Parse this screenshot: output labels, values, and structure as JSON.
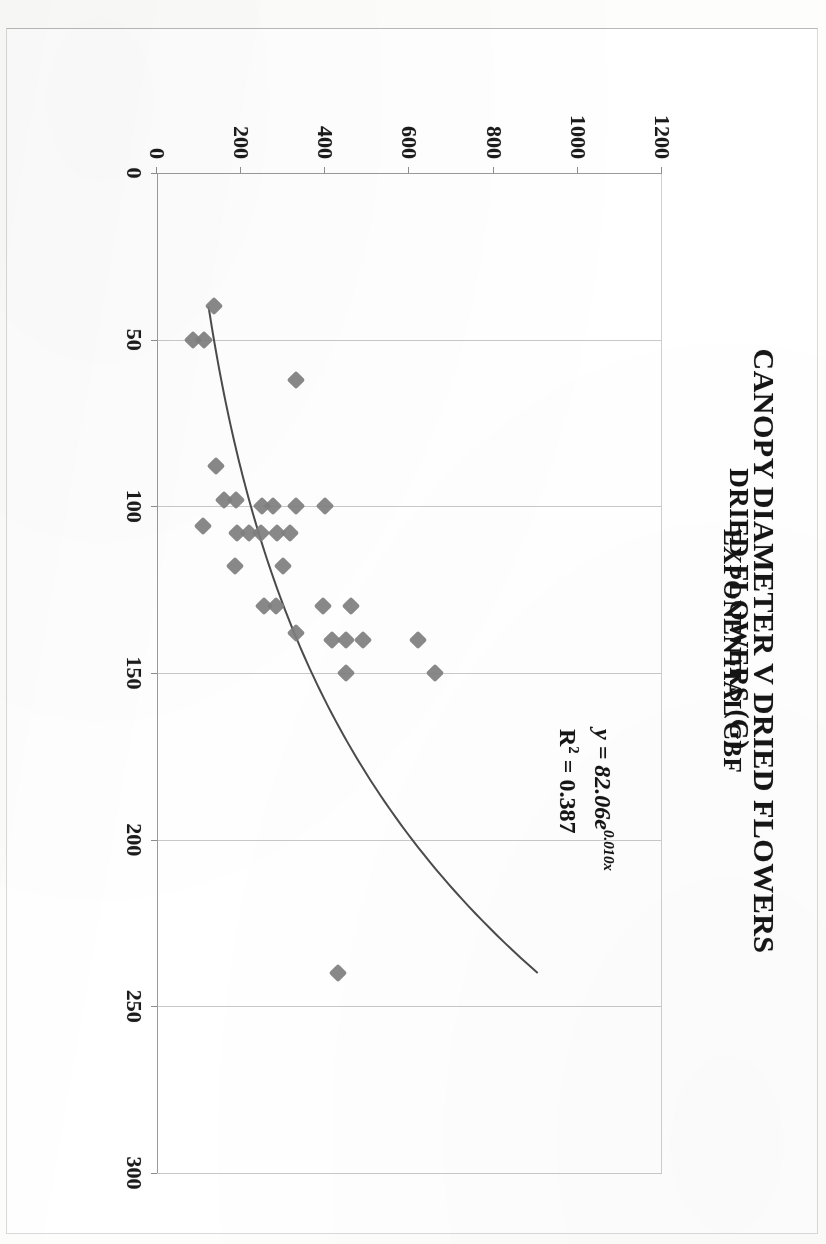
{
  "chart_data": {
    "type": "scatter",
    "title": "CANOPY DIAMETER V DRIED FLOWERS",
    "subtitle": "EXPONENTIAL CBF",
    "xlabel": "CANOPY DIAMETER (CM)",
    "ylabel": "DRIED FLOWERS (G)",
    "xlim": [
      0,
      300
    ],
    "ylim": [
      0,
      1200
    ],
    "xticks": [
      0,
      50,
      100,
      150,
      200,
      250,
      300
    ],
    "yticks": [
      0,
      200,
      400,
      600,
      800,
      1000,
      1200
    ],
    "grid": true,
    "legend": "none",
    "marker": "diamond",
    "marker_color": "#7f7f7f",
    "trendline": {
      "kind": "exponential",
      "equation_text": "y = 82.06e",
      "equation_exponent": "0.010x",
      "r2_label": "R",
      "r2_sup": "2",
      "r2_text": " = 0.387",
      "coefficient": 82.06,
      "rate": 0.01,
      "r_squared": 0.387,
      "color": "#4b4b4b",
      "x_start": 40,
      "x_end": 240
    },
    "points": [
      {
        "x": 40,
        "y": 135
      },
      {
        "x": 50,
        "y": 85
      },
      {
        "x": 50,
        "y": 112
      },
      {
        "x": 62,
        "y": 330
      },
      {
        "x": 88,
        "y": 140
      },
      {
        "x": 98,
        "y": 160
      },
      {
        "x": 98,
        "y": 188
      },
      {
        "x": 100,
        "y": 250
      },
      {
        "x": 100,
        "y": 275
      },
      {
        "x": 100,
        "y": 330
      },
      {
        "x": 100,
        "y": 400
      },
      {
        "x": 106,
        "y": 110
      },
      {
        "x": 108,
        "y": 190
      },
      {
        "x": 108,
        "y": 218
      },
      {
        "x": 108,
        "y": 248
      },
      {
        "x": 108,
        "y": 285
      },
      {
        "x": 108,
        "y": 315
      },
      {
        "x": 118,
        "y": 185
      },
      {
        "x": 118,
        "y": 300
      },
      {
        "x": 130,
        "y": 255
      },
      {
        "x": 130,
        "y": 282
      },
      {
        "x": 130,
        "y": 395
      },
      {
        "x": 130,
        "y": 460
      },
      {
        "x": 138,
        "y": 330
      },
      {
        "x": 140,
        "y": 415
      },
      {
        "x": 140,
        "y": 450
      },
      {
        "x": 140,
        "y": 490
      },
      {
        "x": 140,
        "y": 620
      },
      {
        "x": 150,
        "y": 450
      },
      {
        "x": 150,
        "y": 660
      },
      {
        "x": 240,
        "y": 430
      }
    ]
  },
  "axis_titles": {
    "y": "DRIED FLOWERS (G)",
    "x": "CANOPY DIAMETER (CM)"
  }
}
